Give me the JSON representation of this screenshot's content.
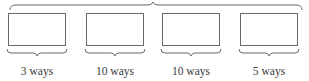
{
  "diagram": {
    "stroke_color": "#6a6a6a",
    "slots": [
      {
        "label": "3 ways"
      },
      {
        "label": "10 ways"
      },
      {
        "label": "10 ways"
      },
      {
        "label": "5 ways"
      }
    ]
  }
}
